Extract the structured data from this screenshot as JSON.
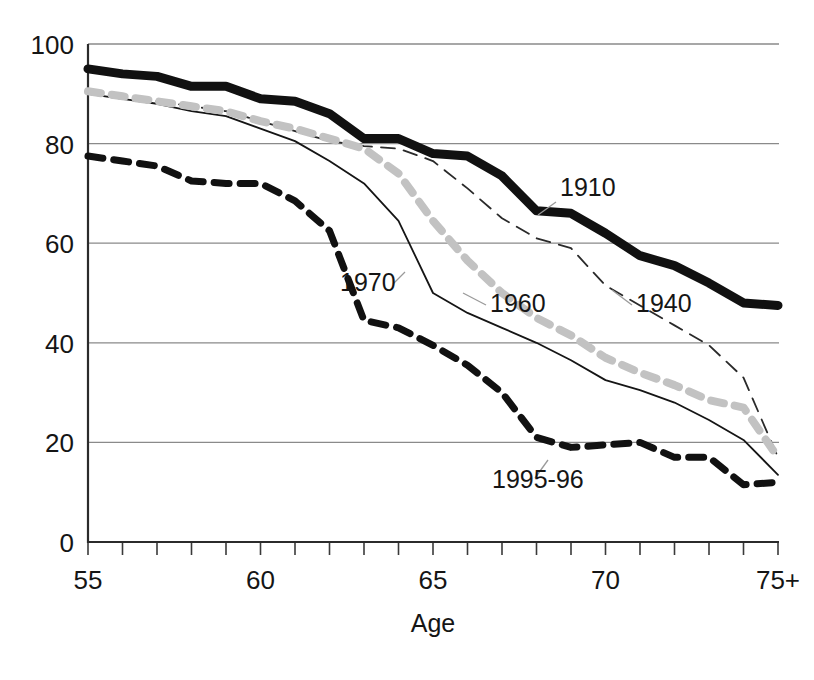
{
  "chart_data": {
    "type": "line",
    "title": "",
    "subtitle": "",
    "xlabel": "Age",
    "ylabel": "",
    "xlim": [
      55,
      75
    ],
    "ylim": [
      0,
      100
    ],
    "grid": true,
    "legend_position": "inline-labels",
    "x": [
      55,
      56,
      57,
      58,
      59,
      60,
      61,
      62,
      63,
      64,
      65,
      66,
      67,
      68,
      69,
      70,
      71,
      72,
      73,
      74,
      75
    ],
    "xtick_values": [
      55,
      60,
      65,
      70,
      75
    ],
    "xtick_labels": [
      "55",
      "60",
      "65",
      "70",
      "75+"
    ],
    "ytick_values": [
      0,
      20,
      40,
      60,
      80,
      100
    ],
    "ytick_labels": [
      "0",
      "20",
      "40",
      "60",
      "80",
      "100"
    ],
    "series": [
      {
        "name": "1910",
        "label": "1910",
        "color": "#111111",
        "style": "solid-thick",
        "stroke_width": 9,
        "dasharray": "",
        "label_x": 560,
        "label_y": 196,
        "leader": "M 556 202 L 538 215",
        "values": [
          95,
          94,
          93.5,
          91.5,
          91.5,
          89,
          88.5,
          86,
          81,
          81,
          78,
          77.5,
          73.5,
          66.5,
          66,
          62,
          57.5,
          55.5,
          52,
          48,
          47.5
        ]
      },
      {
        "name": "1940",
        "label": "1940",
        "color": "#2a2a2a",
        "style": "dashed-thin",
        "stroke_width": 1.8,
        "dasharray": "14 9",
        "label_x": 636,
        "label_y": 312,
        "leader": "M 632 305 L 612 290",
        "values": [
          90.5,
          89.5,
          88.5,
          87.5,
          86.5,
          84.5,
          82.5,
          80.5,
          79.5,
          79,
          76.5,
          71,
          65,
          61,
          59,
          51.5,
          47.5,
          43.5,
          39.5,
          33,
          17
        ]
      },
      {
        "name": "1960",
        "label": "1960",
        "color": "#c2c2c2",
        "style": "dashed-thick",
        "stroke_width": 8,
        "dasharray": "13 11",
        "label_x": 490,
        "label_y": 312,
        "leader": "M 486 305 L 463 293"
      },
      {
        "name": "1960-values",
        "label": "",
        "color": "#c2c2c2",
        "style": "hidden",
        "values": [
          90.5,
          89.5,
          88.5,
          87.5,
          86.5,
          84.5,
          83,
          81,
          79,
          74,
          64.5,
          56.5,
          50,
          45,
          41.5,
          37,
          34,
          31.5,
          28.5,
          27,
          17
        ]
      },
      {
        "name": "1970",
        "label": "1970",
        "color": "#151515",
        "style": "solid-thin",
        "stroke_width": 1.8,
        "dasharray": "",
        "label_x": 340,
        "label_y": 291,
        "leader": "M 393 284 L 405 272"
      },
      {
        "name": "1970-values",
        "label": "",
        "color": "#151515",
        "style": "hidden",
        "values": [
          90,
          89,
          88,
          86.5,
          85.5,
          83,
          80.5,
          76.5,
          72,
          64.5,
          50,
          46,
          43,
          40,
          36.5,
          32.5,
          30.5,
          28,
          24.5,
          20.5,
          13.5
        ]
      },
      {
        "name": "1995-96",
        "label": "1995-96",
        "color": "#111111",
        "style": "dashed-black",
        "stroke_width": 7,
        "dasharray": "15 11",
        "label_x": 492,
        "label_y": 488,
        "leader": "M 535 478 L 548 460"
      },
      {
        "name": "1995-96-values",
        "label": "",
        "color": "#111111",
        "style": "hidden",
        "values": [
          77.5,
          76.5,
          75.5,
          72.5,
          72,
          72,
          68.5,
          62.5,
          44.5,
          43,
          39.5,
          35.5,
          30,
          21,
          19,
          19.5,
          20,
          17,
          17,
          11.5,
          12
        ]
      }
    ],
    "annotations": [
      {
        "text": "1910"
      },
      {
        "text": "1940"
      },
      {
        "text": "1960"
      },
      {
        "text": "1970"
      },
      {
        "text": "1995-96"
      }
    ],
    "colors": {
      "axis": "#2b2b2b",
      "grid": "#8a8a8a",
      "background": "#ffffff",
      "series_1910": "#111111",
      "series_1940": "#2a2a2a",
      "series_1960": "#c2c2c2",
      "series_1970": "#151515",
      "series_1995_96": "#111111"
    }
  }
}
